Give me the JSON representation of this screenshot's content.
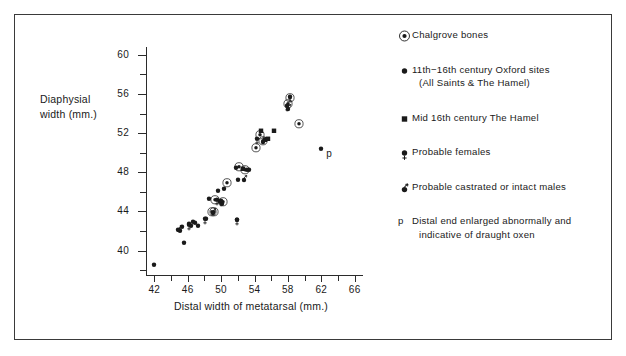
{
  "chart_data": {
    "type": "scatter",
    "title": "",
    "xlabel": "Distal width of metatarsal (mm.)",
    "ylabel": "Diaphysial width (mm.)",
    "ylabel_lines": [
      "Diaphysial",
      "width (mm.)"
    ],
    "xlim": [
      41,
      67
    ],
    "ylim": [
      37.5,
      60.8
    ],
    "xticks_major": [
      42,
      46,
      50,
      54,
      58,
      62,
      66
    ],
    "xticks_minor": [
      44,
      48,
      52,
      56,
      60,
      64
    ],
    "yticks_major": [
      40,
      44,
      48,
      52,
      56,
      60
    ],
    "yticks_minor": [
      38,
      42,
      46,
      50,
      54,
      58
    ],
    "grid": false,
    "legend_position": "right",
    "series": [
      {
        "name": "Chalgrove bones",
        "marker": "dot-in-circle",
        "points": [
          [
            48.9,
            43.6
          ],
          [
            49.2,
            43.6
          ],
          [
            49.3,
            44.8
          ],
          [
            50.2,
            44.6
          ],
          [
            50.7,
            46.5
          ],
          [
            52.2,
            48.2
          ],
          [
            52.9,
            47.9
          ],
          [
            54.2,
            50.1
          ],
          [
            54.7,
            51.4
          ],
          [
            55.0,
            50.8
          ],
          [
            58.0,
            54.6
          ],
          [
            58.3,
            55.2
          ],
          [
            59.3,
            52.6
          ]
        ]
      },
      {
        "name": "11th-16th century Oxford sites (All Saints & The Hamel)",
        "marker": "filled-dot",
        "points": [
          [
            42.0,
            38.2
          ],
          [
            45.6,
            40.4
          ],
          [
            44.8,
            41.7
          ],
          [
            45.1,
            41.6
          ],
          [
            45.3,
            42.0
          ],
          [
            46.2,
            42.4
          ],
          [
            46.4,
            42.2
          ],
          [
            46.6,
            42.6
          ],
          [
            46.9,
            42.5
          ],
          [
            47.2,
            42.2
          ],
          [
            48.2,
            42.9
          ],
          [
            48.6,
            44.9
          ],
          [
            49.6,
            45.7
          ],
          [
            49.9,
            44.6
          ],
          [
            50.1,
            44.4
          ],
          [
            50.4,
            45.9
          ],
          [
            51.8,
            48.1
          ],
          [
            51.9,
            42.8
          ],
          [
            52.0,
            46.8
          ],
          [
            53.1,
            47.9
          ],
          [
            53.4,
            47.9
          ],
          [
            62.0,
            50.0
          ]
        ]
      },
      {
        "name": "Mid 16th century The Hamel",
        "marker": "filled-square",
        "points": [
          [
            52.6,
            48.0
          ],
          [
            54.8,
            51.9
          ],
          [
            55.2,
            50.9
          ],
          [
            55.6,
            51.0
          ],
          [
            56.3,
            51.9
          ]
        ]
      },
      {
        "name": "Probable females",
        "marker": "dot-female",
        "points": [
          [
            46.2,
            42.3
          ],
          [
            48.1,
            42.9
          ],
          [
            49.5,
            44.8
          ],
          [
            50.0,
            44.7
          ],
          [
            51.9,
            42.8
          ],
          [
            54.3,
            51.0
          ],
          [
            57.9,
            54.4
          ],
          [
            58.2,
            55.3
          ]
        ]
      },
      {
        "name": "Probable castrated or intact males",
        "marker": "dot-male",
        "points": [
          [
            44.9,
            41.8
          ],
          [
            49.0,
            43.6
          ],
          [
            52.7,
            47.0
          ],
          [
            55.0,
            50.8
          ],
          [
            58.0,
            54.2
          ]
        ]
      }
    ],
    "annotations": [
      {
        "text": "p",
        "x": 62.0,
        "y": 50.0,
        "note": "Distal end enlarged abnormally and indicative of draught oxen"
      }
    ]
  },
  "legend": {
    "entries": [
      {
        "marker": "dot-in-circle-icon",
        "lines": [
          "Chalgrove bones"
        ]
      },
      {
        "marker": "filled-dot-icon",
        "lines": [
          "11th−16th century Oxford sites",
          "(All Saints & The Hamel)"
        ]
      },
      {
        "marker": "filled-square-icon",
        "lines": [
          "Mid 16th century The Hamel"
        ]
      },
      {
        "marker": "dot-female-icon",
        "lines": [
          "Probable females"
        ]
      },
      {
        "marker": "dot-male-icon",
        "lines": [
          "Probable castrated or intact males"
        ]
      },
      {
        "marker": "p-char",
        "marker_char": "p",
        "lines": [
          "Distal end enlarged abnormally and",
          "indicative of draught oxen"
        ]
      }
    ]
  },
  "colors": {
    "ink": "#1a1a1a",
    "axis": "#2b2b2b",
    "frame": "#3a3a3a",
    "background": "#ffffff"
  }
}
